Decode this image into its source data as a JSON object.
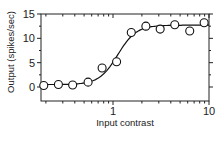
{
  "chart_data": {
    "type": "scatter",
    "title": "",
    "xlabel": "Input contrast",
    "ylabel": "Output (spikes/sec)",
    "xscale": "log",
    "xlim": [
      0.178,
      10
    ],
    "ylim": [
      -0.5,
      15
    ],
    "x_ticks": [
      {
        "value": 1,
        "label": "1"
      },
      {
        "value": 10,
        "label": "10"
      }
    ],
    "y_ticks": [
      {
        "value": 0,
        "label": "0"
      },
      {
        "value": 5,
        "label": "5"
      },
      {
        "value": 10,
        "label": "10"
      },
      {
        "value": 15,
        "label": "15"
      }
    ],
    "grid": false,
    "legend": null,
    "series": [
      {
        "name": "Measured responses",
        "marker": "open-circle",
        "x": [
          0.19,
          0.27,
          0.38,
          0.55,
          0.77,
          1.09,
          1.55,
          2.2,
          3.1,
          4.4,
          6.3,
          8.9
        ],
        "y": [
          0.3,
          0.5,
          0.4,
          1.0,
          3.9,
          5.2,
          11.2,
          12.5,
          11.9,
          12.8,
          11.5,
          13.2
        ]
      },
      {
        "name": "Sigmoid fit",
        "line": "solid",
        "model": "y = base + (max-base) * x^n / (x^n + c50^n)",
        "params": {
          "base": 0.5,
          "max": 12.7,
          "c50": 1.12,
          "n": 4.5
        }
      }
    ]
  }
}
